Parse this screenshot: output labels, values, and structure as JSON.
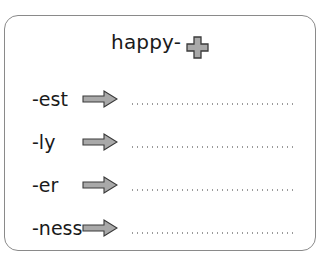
{
  "worksheet": {
    "root_word": "happy-",
    "operator_icon": "plus-icon",
    "colors": {
      "border": "#8a8a8a",
      "icon_fill": "#a9a9a9",
      "icon_outline": "#3a3a3a",
      "dots": "#9a9a9a"
    },
    "rows": [
      {
        "suffix": "-est",
        "icon": "arrow-right-icon",
        "answer": ""
      },
      {
        "suffix": "-ly",
        "icon": "arrow-right-icon",
        "answer": ""
      },
      {
        "suffix": "-er",
        "icon": "arrow-right-icon",
        "answer": ""
      },
      {
        "suffix": "-ness",
        "icon": "arrow-right-icon",
        "answer": ""
      }
    ]
  }
}
